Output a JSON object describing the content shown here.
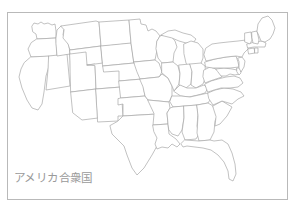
{
  "page": {
    "background_color": "#ffffff",
    "width": 296,
    "height": 209
  },
  "frame": {
    "name": "map-border-frame",
    "stroke_color": "#b9b9b9",
    "x": 7,
    "y": 12,
    "width": 281,
    "height": 188
  },
  "caption": {
    "text": "アメリカ合衆国",
    "color": "#9a9a9a",
    "font_size_px": 11.5
  },
  "map": {
    "title": "アメリカ合衆国",
    "subject": "contiguous-united-states-outline-map",
    "outline_color": "#a8a8a8",
    "fill_color": "#ffffff",
    "regions": [
      "Washington",
      "Oregon",
      "California",
      "Nevada",
      "Idaho",
      "Montana",
      "Wyoming",
      "Utah",
      "Arizona",
      "Colorado",
      "New Mexico",
      "North Dakota",
      "South Dakota",
      "Nebraska",
      "Kansas",
      "Oklahoma",
      "Texas",
      "Minnesota",
      "Iowa",
      "Missouri",
      "Arkansas",
      "Louisiana",
      "Wisconsin",
      "Illinois",
      "Michigan",
      "Indiana",
      "Ohio",
      "Kentucky",
      "Tennessee",
      "Mississippi",
      "Alabama",
      "Georgia",
      "Florida",
      "South Carolina",
      "North Carolina",
      "Virginia",
      "West Virginia",
      "Maryland",
      "Delaware",
      "Pennsylvania",
      "New Jersey",
      "New York",
      "Connecticut",
      "Rhode Island",
      "Massachusetts",
      "Vermont",
      "New Hampshire",
      "Maine"
    ]
  }
}
